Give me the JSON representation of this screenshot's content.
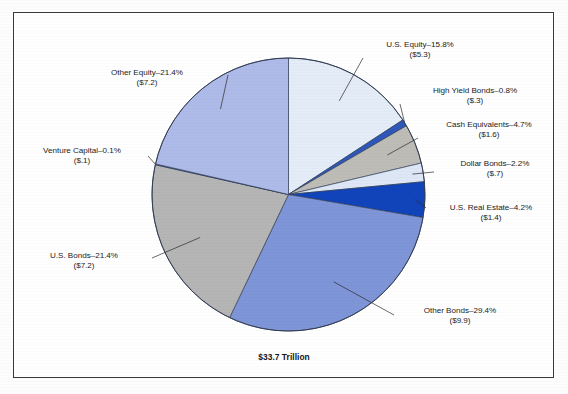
{
  "figure": {
    "total_label": "$33.7 Trillion",
    "border_color": "#3a3a3a",
    "background_color": "#ffffff"
  },
  "chart_data": {
    "type": "pie",
    "title": "$33.7 Trillion",
    "subtitle": "",
    "xlabel": "",
    "ylabel": "",
    "units": "Trillions of U.S. dollars",
    "total": 33.7,
    "total_display": "$33.7 Trillion",
    "start_angle_deg": 0,
    "direction": "clockwise",
    "legend_position": "callout-labels",
    "grid": false,
    "categories": [
      "U.S. Equity",
      "High Yield Bonds",
      "Cash Equivalents",
      "Dollar Bonds",
      "U.S. Real Estate",
      "Other Bonds",
      "U.S. Bonds",
      "Venture Capital",
      "Other Equity"
    ],
    "values": [
      15.8,
      0.8,
      4.7,
      2.2,
      4.2,
      29.4,
      21.4,
      0.1,
      21.4
    ],
    "amounts": [
      5.3,
      0.3,
      1.6,
      0.7,
      1.4,
      9.9,
      7.2,
      0.1,
      7.2
    ],
    "amount_labels": [
      "($5.3)",
      "($.3)",
      "($1.6)",
      "($.7)",
      "($1.4)",
      "($9.9)",
      "($7.2)",
      "($.1)",
      "($7.2)"
    ],
    "percent_labels": [
      "15.8%",
      "0.8%",
      "4.7%",
      "2.2%",
      "4.2%",
      "29.4%",
      "21.4%",
      "0.1%",
      "21.4%"
    ],
    "colors": [
      "#e3ecf7",
      "#2f57bb",
      "#bdbcb6",
      "#dde7f5",
      "#1144bb",
      "#7e95d8",
      "#b4b5b4",
      "#2f57bb",
      "#aebae8"
    ],
    "slices": [
      {
        "name": "U.S. Equity",
        "percent": 15.8,
        "amount": 5.3,
        "label_line1": "U.S. Equity–15.8%",
        "label_line2": "($5.3)",
        "color": "#e3ecf7"
      },
      {
        "name": "High Yield Bonds",
        "percent": 0.8,
        "amount": 0.3,
        "label_line1": "High Yield Bonds–0.8%",
        "label_line2": "($.3)",
        "color": "#2f57bb"
      },
      {
        "name": "Cash Equivalents",
        "percent": 4.7,
        "amount": 1.6,
        "label_line1": "Cash Equivalents–4.7%",
        "label_line2": "($1.6)",
        "color": "#bdbcb6"
      },
      {
        "name": "Dollar Bonds",
        "percent": 2.2,
        "amount": 0.7,
        "label_line1": "Dollar Bonds–2.2%",
        "label_line2": "($.7)",
        "color": "#dde7f5"
      },
      {
        "name": "U.S. Real Estate",
        "percent": 4.2,
        "amount": 1.4,
        "label_line1": "U.S. Real Estate–4.2%",
        "label_line2": "($1.4)",
        "color": "#1144bb"
      },
      {
        "name": "Other Bonds",
        "percent": 29.4,
        "amount": 9.9,
        "label_line1": "Other Bonds–29.4%",
        "label_line2": "($9.9)",
        "color": "#7e95d8"
      },
      {
        "name": "U.S. Bonds",
        "percent": 21.4,
        "amount": 7.2,
        "label_line1": "U.S. Bonds–21.4%",
        "label_line2": "($7.2)",
        "color": "#b4b5b4"
      },
      {
        "name": "Venture Capital",
        "percent": 0.1,
        "amount": 0.1,
        "label_line1": "Venture Capital–0.1%",
        "label_line2": "($.1)",
        "color": "#2f57bb"
      },
      {
        "name": "Other Equity",
        "percent": 21.4,
        "amount": 7.2,
        "label_line1": "Other Equity–21.4%",
        "label_line2": "($7.2)",
        "color": "#aebae8"
      }
    ]
  }
}
